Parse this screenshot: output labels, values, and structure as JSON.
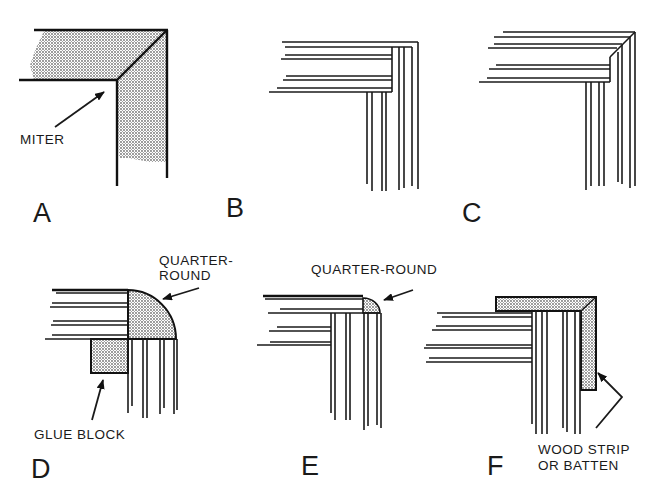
{
  "figure": {
    "ink_color": "#1a1a1a",
    "shade_color": "#8a8a8a",
    "background": "#ffffff"
  },
  "panels": [
    {
      "id": "A",
      "label": "A",
      "callouts": [
        {
          "text": "MITER",
          "arrow": true
        }
      ]
    },
    {
      "id": "B",
      "label": "B",
      "callouts": []
    },
    {
      "id": "C",
      "label": "C",
      "callouts": []
    },
    {
      "id": "D",
      "label": "D",
      "callouts": [
        {
          "text_lines": [
            "QUARTER-",
            "ROUND"
          ],
          "arrow": true
        },
        {
          "text": "GLUE BLOCK",
          "arrow": true
        }
      ]
    },
    {
      "id": "E",
      "label": "E",
      "callouts": [
        {
          "text": "QUARTER-ROUND",
          "arrow": true
        }
      ]
    },
    {
      "id": "F",
      "label": "F",
      "callouts": [
        {
          "text_lines": [
            "WOOD STRIP",
            "OR BATTEN"
          ],
          "arrow": true
        }
      ]
    }
  ],
  "labels": {
    "a": "A",
    "b": "B",
    "c": "C",
    "d": "D",
    "e": "E",
    "f": "F",
    "miter": "MITER",
    "quarter_round_d_1": "QUARTER-",
    "quarter_round_d_2": "ROUND",
    "glue_block": "GLUE BLOCK",
    "quarter_round_e": "QUARTER-ROUND",
    "wood_strip_1": "WOOD STRIP",
    "wood_strip_2": "OR BATTEN"
  }
}
